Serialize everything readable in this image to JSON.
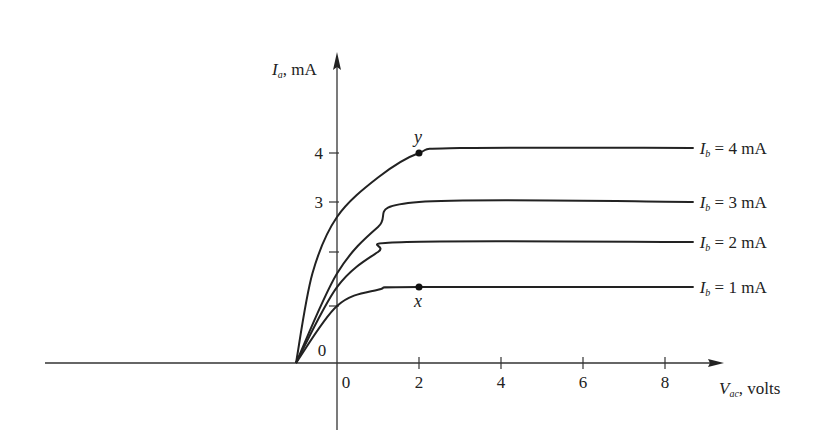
{
  "chart_data": {
    "type": "line",
    "title": "",
    "xlabel": "V_ac, volts",
    "ylabel": "I_a, mA",
    "xlabel_main": "V",
    "xlabel_sub": "ac",
    "xlabel_unit": ", volts",
    "ylabel_main": "I",
    "ylabel_sub": "a",
    "ylabel_unit": ", mA",
    "x_ticks": [
      0,
      2,
      4,
      6,
      8
    ],
    "y_ticks": [
      1,
      2,
      3,
      4
    ],
    "y_tick_labels": [
      "",
      "",
      "3",
      "4"
    ],
    "origin_label": "0",
    "xlim": [
      -7.2,
      9.3
    ],
    "ylim": [
      -1.3,
      6.2
    ],
    "grid": false,
    "series": [
      {
        "name": "I_b = 4 mA",
        "label_main": "I",
        "label_sub": "b",
        "label_rest": " = 4 mA",
        "saturation": 4.1,
        "points": [
          [
            -1.0,
            0
          ],
          [
            -0.6,
            1.6
          ],
          [
            0,
            2.7
          ],
          [
            1,
            3.5
          ],
          [
            2,
            4.0
          ],
          [
            3,
            4.1
          ],
          [
            8.7,
            4.1
          ]
        ]
      },
      {
        "name": "I_b = 3 mA",
        "label_main": "I",
        "label_sub": "b",
        "label_rest": " = 3 mA",
        "saturation": 3.0,
        "points": [
          [
            -1.0,
            0
          ],
          [
            0,
            1.6
          ],
          [
            1,
            2.5
          ],
          [
            2,
            3.0
          ],
          [
            8.7,
            3.0
          ]
        ]
      },
      {
        "name": "I_b = 2 mA",
        "label_main": "I",
        "label_sub": "b",
        "label_rest": " = 2 mA",
        "saturation": 2.2,
        "points": [
          [
            -1.0,
            0
          ],
          [
            0,
            1.35
          ],
          [
            1,
            2.0
          ],
          [
            1.7,
            2.2
          ],
          [
            8.7,
            2.2
          ]
        ]
      },
      {
        "name": "I_b = 1 mA",
        "label_main": "I",
        "label_sub": "b",
        "label_rest": " = 1 mA",
        "saturation": 1.35,
        "points": [
          [
            -1.0,
            0
          ],
          [
            0,
            1.0
          ],
          [
            1,
            1.3
          ],
          [
            2,
            1.35
          ],
          [
            8.7,
            1.35
          ]
        ]
      }
    ],
    "annotations": [
      {
        "label": "x",
        "x": 2,
        "y": 1.35,
        "position": "below"
      },
      {
        "label": "y",
        "x": 2,
        "y": 4.0,
        "position": "above"
      }
    ],
    "legend_position": "inline-right"
  }
}
